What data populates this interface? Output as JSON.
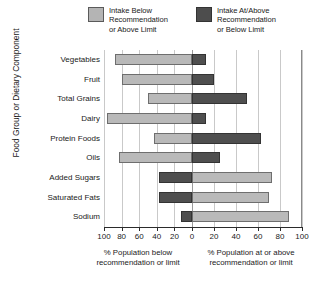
{
  "legend": {
    "items": [
      {
        "label": "Intake Below\nRecommendation\nor Above Limit",
        "swatch": "light-gray-swatch",
        "color": "#b4b4b4"
      },
      {
        "label": "Intake At/Above\nRecommendation\nor Below Limit",
        "swatch": "dark-gray-swatch",
        "color": "#4d4d4d"
      }
    ]
  },
  "axes": {
    "ytitle": "Food Group or Dietary Component",
    "xcaption_left": "% Population below\nrecommendation or limit",
    "xcaption_right": "% Population at or above\nrecommendation or limit",
    "xticks": [
      "100",
      "80",
      "60",
      "40",
      "20",
      "0",
      "20",
      "40",
      "60",
      "80",
      "100"
    ]
  },
  "chart_data": {
    "type": "bar",
    "orientation": "horizontal",
    "subtype": "diverging-stacked",
    "title": "",
    "xlabel": "% Population below recommendation or limit  |  % Population at or above recommendation or limit",
    "ylabel": "Food Group or Dietary Component",
    "xlim": [
      -100,
      100
    ],
    "xticks": [
      -100,
      -80,
      -60,
      -40,
      -20,
      0,
      20,
      40,
      60,
      80,
      100
    ],
    "xtick_labels": [
      "100",
      "80",
      "60",
      "40",
      "20",
      "0",
      "20",
      "40",
      "60",
      "80",
      "100"
    ],
    "grid": true,
    "legend_position": "top",
    "categories": [
      "Vegetables",
      "Fruit",
      "Total Grains",
      "Dairy",
      "Protein Foods",
      "Oils",
      "Added Sugars",
      "Saturated Fats",
      "Sodium"
    ],
    "series": [
      {
        "name": "Intake Below Recommendation or Above Limit",
        "color": "#b9b9b9",
        "side": "left-when-positive",
        "values": [
          87,
          80,
          50,
          97,
          37,
          75,
          -63,
          -73,
          -87
        ]
      },
      {
        "name": "Intake At/Above Recommendation or Below Limit",
        "color": "#4f4f4f",
        "side": "right-when-positive",
        "values": [
          13,
          20,
          50,
          3,
          63,
          25,
          -37,
          -27,
          -13
        ]
      }
    ],
    "bars": [
      {
        "category": "Vegetables",
        "left_value": 87,
        "right_value": 13,
        "left_series": "below",
        "right_series": "at-above"
      },
      {
        "category": "Fruit",
        "left_value": 80,
        "right_value": 20,
        "left_series": "below",
        "right_series": "at-above"
      },
      {
        "category": "Total Grains",
        "left_value": 50,
        "right_value": 50,
        "left_series": "below",
        "right_series": "at-above"
      },
      {
        "category": "Dairy",
        "left_value": 97,
        "right_value": 13,
        "left_series": "below",
        "right_series": "at-above"
      },
      {
        "category": "Protein Foods",
        "left_value": 43,
        "right_value": 63,
        "left_series": "below",
        "right_series": "at-above"
      },
      {
        "category": "Oils",
        "left_value": 83,
        "right_value": 25,
        "left_series": "below",
        "right_series": "at-above"
      },
      {
        "category": "Added Sugars",
        "left_value": 37,
        "right_value": 73,
        "left_series": "at-above",
        "right_series": "below"
      },
      {
        "category": "Saturated Fats",
        "left_value": 37,
        "right_value": 70,
        "left_series": "at-above",
        "right_series": "below"
      },
      {
        "category": "Sodium",
        "left_value": 13,
        "right_value": 88,
        "left_series": "at-above",
        "right_series": "below"
      }
    ]
  }
}
